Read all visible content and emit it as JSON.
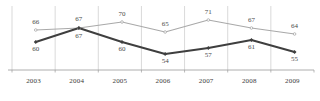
{
  "chart_data": {
    "type": "line",
    "title": "",
    "subtitle": "",
    "xlabel": "",
    "ylabel": "",
    "grid": "vertical-only",
    "legend": "none",
    "categories": [
      "2003",
      "2004",
      "2005",
      "2006",
      "2007",
      "2008",
      "2009"
    ],
    "ylim": [
      50,
      74
    ],
    "series": [
      {
        "name": "upper-gray-series",
        "color": "#a9a9a9",
        "marker": "circle",
        "label_position": "above",
        "values": [
          66,
          67,
          70,
          65,
          71,
          67,
          64
        ]
      },
      {
        "name": "lower-dark-series",
        "color": "#3f3f3f",
        "marker": "diamond",
        "label_position": "below",
        "values": [
          60,
          67,
          60,
          54,
          57,
          61,
          55
        ]
      }
    ]
  },
  "axis": {
    "tick_labels": [
      "2003",
      "2004",
      "2005",
      "2006",
      "2007",
      "2008",
      "2009"
    ],
    "axis_line_color": "#9b9b9b",
    "gridline_color": "#c9c9c9"
  },
  "colors": {
    "series_gray": "#a9a9a9",
    "series_dark": "#3f3f3f",
    "gridline": "#c9c9c9",
    "axis": "#9b9b9b",
    "label_text": "#4a4a4a",
    "background": "#ffffff"
  }
}
